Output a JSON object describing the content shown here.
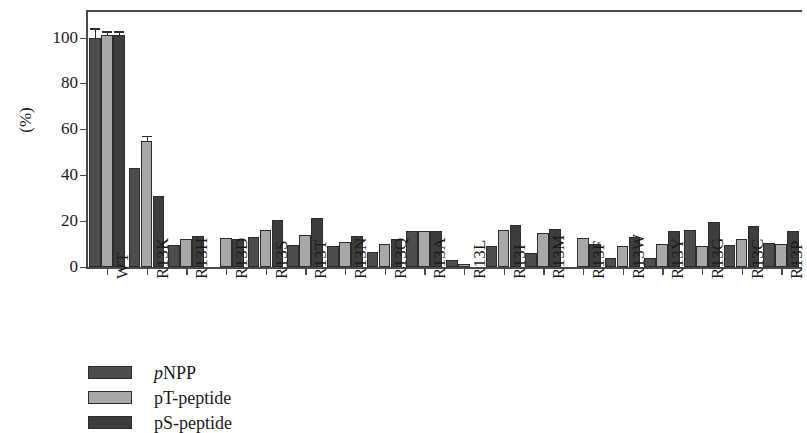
{
  "chart_data": {
    "type": "bar",
    "title": "",
    "xlabel": "",
    "ylabel": "(%)",
    "ylim": [
      0,
      112
    ],
    "yticks": [
      0,
      20,
      40,
      60,
      80,
      100
    ],
    "ytick_labels": [
      "0",
      "20",
      "40",
      "60",
      "80",
      "100"
    ],
    "grid": false,
    "legend_position": "below-left",
    "categories": [
      "WT",
      "R13K",
      "R13H",
      "R13D",
      "R13S",
      "R13T",
      "R13N",
      "R13Q",
      "R13A",
      "R13L",
      "R13I",
      "R13M",
      "R13F",
      "R13W",
      "R13Y",
      "R13G",
      "R13C",
      "R13P"
    ],
    "series": [
      {
        "name": "pNPP",
        "name_italic_prefix": "p",
        "name_rest": "NPP",
        "color": "#4d4d4d",
        "values": [
          100,
          43,
          9.5,
          0,
          13,
          9.5,
          9,
          6.5,
          15.5,
          3,
          9,
          6,
          0,
          4,
          4,
          16,
          9.5,
          10.5
        ],
        "errors": [
          3.5,
          0,
          0,
          0,
          0,
          0,
          0,
          0,
          0,
          0,
          0,
          0,
          0,
          0,
          0,
          0,
          0,
          0
        ]
      },
      {
        "name": "pT-peptide",
        "color": "#a8a8a8",
        "values": [
          101,
          55,
          12,
          12.5,
          16,
          14,
          11,
          10,
          15.5,
          1.5,
          16,
          15,
          12.5,
          9,
          10,
          9,
          12,
          10
        ],
        "errors": [
          1,
          1.5,
          0,
          0,
          0,
          0,
          0,
          0,
          0,
          0,
          0,
          0,
          0,
          0,
          0,
          0,
          0,
          0
        ]
      },
      {
        "name": "pS-peptide",
        "color": "#3d3d3d",
        "values": [
          101,
          31,
          13.5,
          12,
          20.5,
          21.5,
          13.5,
          12,
          15.5,
          0,
          18.5,
          16.5,
          10,
          13,
          15.5,
          19.5,
          18,
          15.5
        ],
        "errors": [
          1,
          0,
          0,
          0,
          0,
          0,
          0,
          0,
          0,
          0,
          0,
          0,
          0,
          0,
          0,
          0,
          0,
          0
        ]
      }
    ]
  }
}
